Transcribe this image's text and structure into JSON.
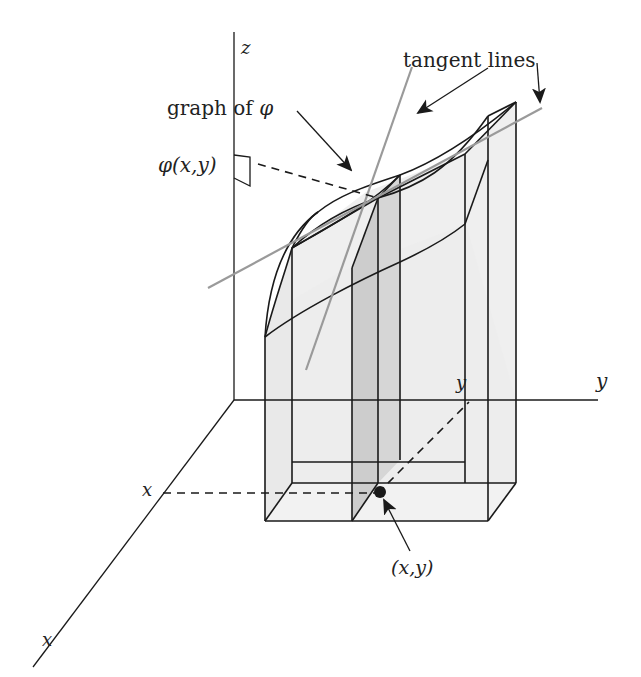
{
  "figure": {
    "colors": {
      "line": "#1a1a1a",
      "tangent_line": "#9a9a9a",
      "light_fill": "#ebebeb",
      "medium_fill": "#c9c9c9",
      "background": "#ffffff"
    }
  },
  "axes": {
    "z_label": "z",
    "y_label": "y",
    "x_label": "x"
  },
  "annotations": {
    "graph_label_text": "graph of ",
    "graph_label_symbol": "φ",
    "tangent_lines_label": "tangent lines",
    "phi_value_label_symbol": "φ",
    "phi_value_label_args": "(x,y)",
    "point_label": "(x,y)",
    "x_tick_label": "x",
    "y_tick_label": "y"
  }
}
